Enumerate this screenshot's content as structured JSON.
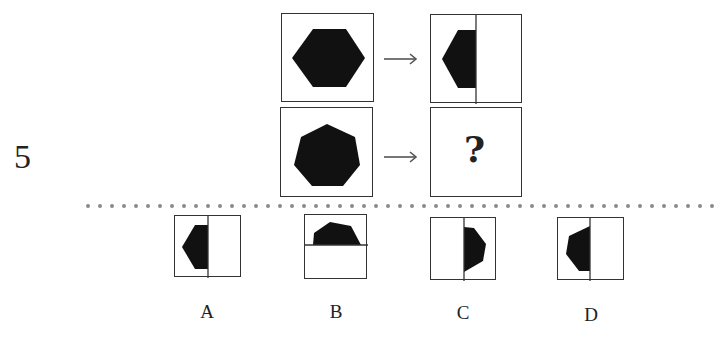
{
  "question": {
    "number": "5",
    "rows": [
      {
        "source_shape": "hexagon",
        "result": "left half of hexagon in split square"
      },
      {
        "source_shape": "heptagon",
        "result": "?"
      }
    ],
    "unknown_mark": "?"
  },
  "separator": {
    "style": "dotted",
    "color": "#888888"
  },
  "options": [
    {
      "label": "A",
      "description": "left half of hexagon, vertical split"
    },
    {
      "label": "B",
      "description": "top half of heptagon, horizontal split"
    },
    {
      "label": "C",
      "description": "right half of heptagon, vertical split"
    },
    {
      "label": "D",
      "description": "left half of heptagon, vertical split"
    }
  ],
  "colors": {
    "shape_fill": "#111111",
    "border": "#333333",
    "arrow": "#555555"
  }
}
